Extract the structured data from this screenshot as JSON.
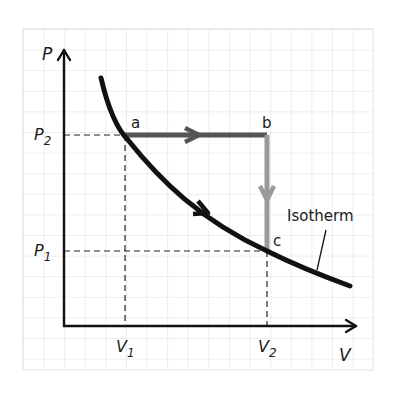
{
  "diagram": {
    "type": "pV-diagram",
    "axes": {
      "y_label": "P",
      "x_label": "V",
      "y_ticks": [
        {
          "main": "P",
          "sub": "2"
        },
        {
          "main": "P",
          "sub": "1"
        }
      ],
      "x_ticks": [
        {
          "main": "V",
          "sub": "1"
        },
        {
          "main": "V",
          "sub": "2"
        }
      ]
    },
    "points": [
      {
        "label": "a",
        "description": "on isotherm at (V1, P2)"
      },
      {
        "label": "b",
        "description": "at (V2, P2)"
      },
      {
        "label": "c",
        "description": "on isotherm at (V2, P1)"
      }
    ],
    "paths": [
      {
        "from": "a",
        "to": "b",
        "kind": "isobaric expansion",
        "color": "#555555"
      },
      {
        "from": "b",
        "to": "c",
        "kind": "isochoric cooling",
        "color": "#999999"
      },
      {
        "from": "a",
        "to": "c",
        "kind": "isothermal expansion",
        "color": "#111111"
      }
    ],
    "curve_label": "Isotherm",
    "colors": {
      "grid": "#d9d9d9",
      "axis": "#111111",
      "isotherm": "#111111",
      "ab_path": "#555555",
      "bc_path": "#999999"
    }
  }
}
